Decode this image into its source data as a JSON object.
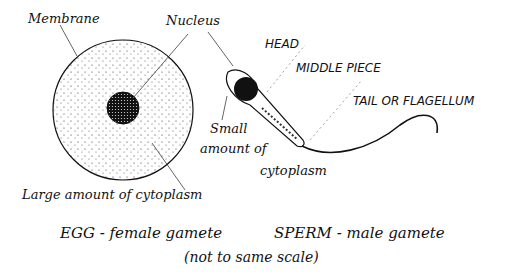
{
  "egg": {
    "membrane_label": "Membrane",
    "nucleus_label": "Nucleus",
    "cytoplasm_label": "Large amount of cytoplasm",
    "caption": "EGG - female gamete"
  },
  "sperm": {
    "head_label": "HEAD",
    "middle_label": "MIDDLE PIECE",
    "tail_label": "TAIL OR FLAGELLUM",
    "cytoplasm_line1": "Small",
    "cytoplasm_line2": "amount of",
    "cytoplasm_line3": "cytoplasm",
    "caption": "SPERM - male gamete"
  },
  "note": "(not to same scale)",
  "colors": {
    "ink": "#111111",
    "background": "#ffffff"
  }
}
